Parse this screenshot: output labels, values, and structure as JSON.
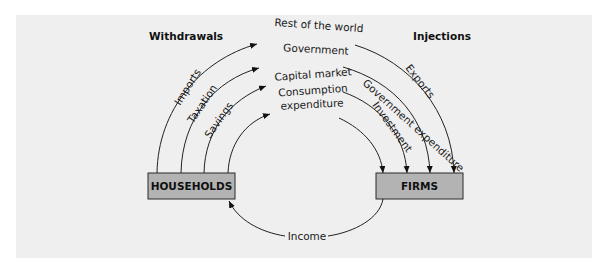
{
  "diagram": {
    "headers": {
      "withdrawals": "Withdrawals",
      "injections": "Injections"
    },
    "nodes": {
      "households": "HOUSEHOLDS",
      "firms": "FIRMS"
    },
    "destinations": {
      "rest_of_world": "Rest of the world",
      "government": "Government",
      "capital_market": "Capital market",
      "consumption_line1": "Consumption",
      "consumption_line2": "expenditure"
    },
    "withdrawal_flows": {
      "imports": "Imports",
      "taxation": "Taxation",
      "savings": "Savings"
    },
    "injection_flows": {
      "exports": "Exports",
      "government_expenditure": "Government expenditure",
      "investment": "Investment"
    },
    "income_flow": "Income",
    "colors": {
      "background": "#efefef",
      "box_fill": "#b3b3b3",
      "line": "#222222"
    }
  }
}
